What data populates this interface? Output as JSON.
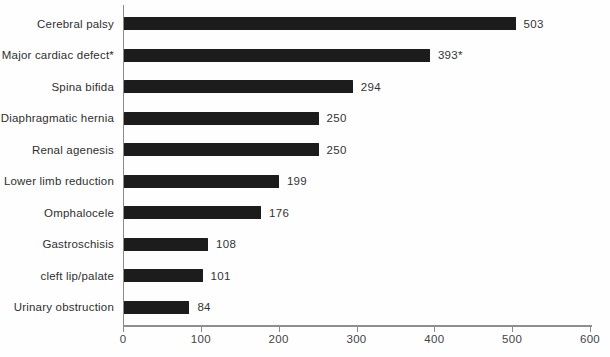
{
  "chart_data": {
    "type": "bar",
    "orientation": "horizontal",
    "title": "",
    "xlabel": "",
    "ylabel": "",
    "grid": false,
    "legend": null,
    "xlim": [
      0,
      600
    ],
    "x_ticks": [
      0,
      100,
      200,
      300,
      400,
      500,
      600
    ],
    "categories": [
      "Cerebral palsy",
      "Major cardiac defect*",
      "Spina bifida",
      "Diaphragmatic hernia",
      "Renal agenesis",
      "Lower limb reduction",
      "Omphalocele",
      "Gastroschisis",
      "cleft lip/palate",
      "Urinary obstruction"
    ],
    "values": [
      503,
      393,
      294,
      250,
      250,
      199,
      176,
      108,
      101,
      84
    ],
    "value_labels": [
      "503",
      "393*",
      "294",
      "250",
      "250",
      "199",
      "176",
      "108",
      "101",
      "84"
    ],
    "colors": {
      "bar": "#1c1c1c",
      "axis": "#8a8a8a",
      "category_text": "#2f2f2f",
      "value_text": "#333333",
      "tick_text": "#444444",
      "background": "#fefefe"
    }
  }
}
